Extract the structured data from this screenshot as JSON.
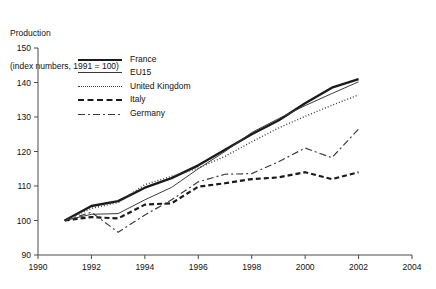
{
  "chart_data": {
    "type": "line",
    "title": "Production",
    "subtitle": "(index numbers, 1991 = 100)",
    "xlabel": "",
    "ylabel": "",
    "xlim": [
      1990,
      2004
    ],
    "ylim": [
      90,
      150
    ],
    "yticks": [
      90,
      100,
      110,
      120,
      130,
      140,
      150
    ],
    "xticks": [
      1990,
      1992,
      1994,
      1996,
      1998,
      2000,
      2002,
      2004
    ],
    "grid": false,
    "legend_position": "upper-left-inside",
    "x": [
      1991,
      1992,
      1993,
      1994,
      1995,
      1996,
      1997,
      1998,
      1999,
      2000,
      2001,
      2002
    ],
    "series": [
      {
        "name": "France",
        "style": "solid-thick",
        "values": [
          100.0,
          104.2,
          105.6,
          109.5,
          112.3,
          116.0,
          120.5,
          125.0,
          129.0,
          134.0,
          138.5,
          141.0
        ]
      },
      {
        "name": "EU15",
        "style": "solid-thin",
        "values": [
          100.0,
          101.8,
          102.0,
          106.0,
          109.6,
          115.0,
          120.0,
          125.5,
          129.5,
          133.3,
          136.8,
          140.2
        ]
      },
      {
        "name": "United Kingdom",
        "style": "dotted",
        "values": [
          100.0,
          103.5,
          105.2,
          110.4,
          112.8,
          115.2,
          118.6,
          122.8,
          126.8,
          130.2,
          133.4,
          136.4
        ]
      },
      {
        "name": "Italy",
        "style": "dashed",
        "values": [
          100.0,
          101.0,
          100.6,
          104.6,
          105.0,
          109.8,
          110.8,
          112.0,
          112.5,
          114.0,
          112.0,
          114.0
        ]
      },
      {
        "name": "Germany",
        "style": "dash-dot",
        "values": [
          100.0,
          102.4,
          96.6,
          101.6,
          106.0,
          111.2,
          113.4,
          113.6,
          117.0,
          121.0,
          118.2,
          126.5
        ]
      }
    ]
  },
  "legend": {
    "items": [
      {
        "label": "France",
        "key": "france-line-key"
      },
      {
        "label": "EU15",
        "key": "eu15-line-key"
      },
      {
        "label": "United Kingdom",
        "key": "uk-line-key"
      },
      {
        "label": "Italy",
        "key": "italy-line-key"
      },
      {
        "label": "Germany",
        "key": "germany-line-key"
      }
    ]
  },
  "axes": {
    "y_tick_labels": [
      "150",
      "140",
      "130",
      "120",
      "110",
      "100",
      "90"
    ],
    "x_tick_labels": [
      "1990",
      "1992",
      "1994",
      "1996",
      "1998",
      "2000",
      "2002",
      "2004"
    ]
  }
}
